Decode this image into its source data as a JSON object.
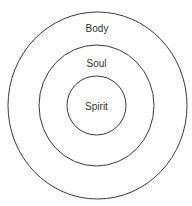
{
  "diagram": {
    "type": "concentric-circles",
    "colors": {
      "stroke": "#3a3a3a",
      "text": "#333333",
      "background": "#ffffff"
    },
    "layers": [
      {
        "label": "Body",
        "position": "outer"
      },
      {
        "label": "Soul",
        "position": "middle"
      },
      {
        "label": "Spirit",
        "position": "inner"
      }
    ]
  }
}
